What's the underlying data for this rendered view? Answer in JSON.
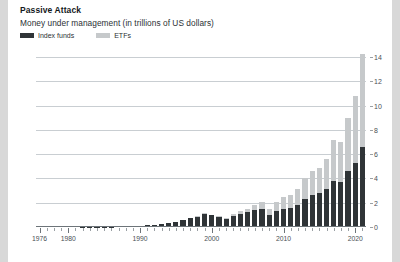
{
  "card": {
    "background": "#ffffff",
    "page_background": "#d8d8d8"
  },
  "header": {
    "title": "Passive Attack",
    "subtitle": "Money under management (in trillions of US dollars)"
  },
  "legend": {
    "position": "top-left",
    "items": [
      {
        "label": "Index funds",
        "color": "#2f3437"
      },
      {
        "label": "ETFs",
        "color": "#c6c9cb"
      }
    ]
  },
  "axes": {
    "y_ticks": [
      "0",
      "2",
      "4",
      "6",
      "8",
      "10",
      "12",
      "14"
    ],
    "y_label_side": "right",
    "x_ticks": [
      "1976",
      "1980",
      "1990",
      "2000",
      "2010",
      "2020"
    ]
  },
  "chart_data": {
    "type": "bar",
    "stacked": true,
    "title": "Passive Attack",
    "subtitle": "Money under management (in trillions of US dollars)",
    "xlabel": "",
    "ylabel": "",
    "ylim": [
      0,
      15
    ],
    "ytick_values": [
      0,
      2,
      4,
      6,
      8,
      10,
      12,
      14
    ],
    "xtick_values": [
      1976,
      1980,
      1990,
      2000,
      2010,
      2020
    ],
    "grid": true,
    "legend_position": "top-left",
    "categories": [
      1976,
      1977,
      1978,
      1979,
      1980,
      1981,
      1982,
      1983,
      1984,
      1985,
      1986,
      1987,
      1988,
      1989,
      1990,
      1991,
      1992,
      1993,
      1994,
      1995,
      1996,
      1997,
      1998,
      1999,
      2000,
      2001,
      2002,
      2003,
      2004,
      2005,
      2006,
      2007,
      2008,
      2009,
      2010,
      2011,
      2012,
      2013,
      2014,
      2015,
      2016,
      2017,
      2018,
      2019,
      2020,
      2021
    ],
    "series": [
      {
        "name": "Index funds",
        "color": "#2f3437",
        "values": [
          0.0,
          0.0,
          0.0,
          0.0,
          0.0,
          0.0,
          0.01,
          0.01,
          0.02,
          0.03,
          0.04,
          0.05,
          0.06,
          0.08,
          0.1,
          0.14,
          0.19,
          0.26,
          0.3,
          0.42,
          0.54,
          0.72,
          0.86,
          1.05,
          0.95,
          0.82,
          0.68,
          0.9,
          1.05,
          1.2,
          1.4,
          1.5,
          1.0,
          1.3,
          1.5,
          1.55,
          1.8,
          2.3,
          2.6,
          2.8,
          3.1,
          3.8,
          3.7,
          4.6,
          5.3,
          6.6
        ]
      },
      {
        "name": "ETFs",
        "color": "#c6c9cb",
        "values": [
          0.0,
          0.0,
          0.0,
          0.0,
          0.0,
          0.0,
          0.0,
          0.0,
          0.0,
          0.0,
          0.0,
          0.0,
          0.0,
          0.0,
          0.0,
          0.0,
          0.0,
          0.005,
          0.01,
          0.01,
          0.02,
          0.03,
          0.05,
          0.08,
          0.07,
          0.08,
          0.1,
          0.15,
          0.23,
          0.3,
          0.42,
          0.6,
          0.5,
          0.78,
          1.0,
          1.05,
          1.35,
          1.7,
          2.0,
          2.1,
          2.5,
          3.4,
          3.3,
          4.4,
          5.5,
          7.7
        ]
      }
    ]
  }
}
